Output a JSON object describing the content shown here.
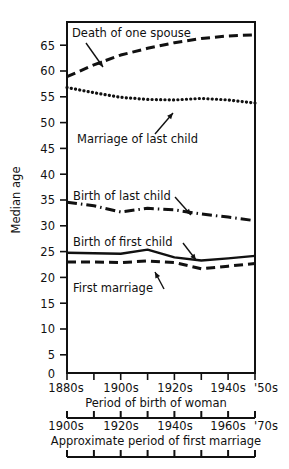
{
  "chart_data": {
    "type": "line",
    "title": "",
    "xlabel": "Period of birth of woman",
    "ylabel": "Median age",
    "secondary_xlabel": "Approximate period of first marriage",
    "ylim": [
      0,
      68
    ],
    "yticks": [
      0,
      5,
      10,
      15,
      20,
      25,
      30,
      35,
      40,
      45,
      50,
      55,
      60,
      65
    ],
    "ytick_labels": [
      "0",
      "5",
      "10",
      "15",
      "20",
      "25",
      "30",
      "35",
      "40",
      "45",
      "50",
      "55",
      "60",
      "65"
    ],
    "grid": false,
    "legend_position": "inline-annotations",
    "x": [
      1880,
      1890,
      1900,
      1910,
      1920,
      1930,
      1940,
      1950
    ],
    "xtick_labels": [
      "1880s",
      "",
      "1900s",
      "",
      "1920s",
      "",
      "1940s",
      "'50s"
    ],
    "xtick_labels_full": [
      "1880s",
      "1890s",
      "1900s",
      "1910s",
      "1920s",
      "1930s",
      "1940s",
      "'50s"
    ],
    "secondary_xtick_labels": [
      "1900s",
      "",
      "1920s",
      "",
      "1940s",
      "",
      "1960s",
      "'70s"
    ],
    "secondary_xtick_labels_full": [
      "1900s",
      "1910s",
      "1920s",
      "1930s",
      "1940s",
      "1950s",
      "1960s",
      "'70s"
    ],
    "series": [
      {
        "name": "Death of one spouse",
        "style": "dashed",
        "values": [
          57.4,
          59.7,
          61.6,
          62.9,
          64.0,
          64.8,
          65.3,
          65.5
        ],
        "label_text": "Death of one spouse",
        "label_x": 72,
        "label_y": 37,
        "arrow_from_x": 86,
        "arrow_from_y": 43,
        "arrow_to_x": 103,
        "arrow_to_y": 67
      },
      {
        "name": "Marriage of last child",
        "style": "dotted",
        "values": [
          55.3,
          54.3,
          53.4,
          53.0,
          52.9,
          53.2,
          52.9,
          52.3
        ],
        "label_text": "Marriage of last child",
        "label_x": 77,
        "label_y": 143,
        "arrow_from_x": 155,
        "arrow_from_y": 134,
        "arrow_to_x": 173,
        "arrow_to_y": 113
      },
      {
        "name": "Birth of last child",
        "style": "dashdot",
        "values": [
          33.1,
          32.4,
          31.2,
          31.9,
          31.6,
          30.8,
          30.2,
          29.5
        ],
        "label_text": "Birth of last child",
        "label_x": 73,
        "label_y": 200,
        "arrow_from_x": 175,
        "arrow_from_y": 197,
        "arrow_to_x": 191,
        "arrow_to_y": 215
      },
      {
        "name": "Birth of first child",
        "style": "solid",
        "values": [
          23.3,
          23.2,
          23.1,
          23.9,
          22.4,
          21.8,
          22.2,
          22.7
        ],
        "label_text": "Birth of first child",
        "label_x": 73,
        "label_y": 246,
        "arrow_from_x": 183,
        "arrow_from_y": 243,
        "arrow_to_x": 196,
        "arrow_to_y": 260
      },
      {
        "name": "First marriage",
        "style": "dashed",
        "values": [
          21.5,
          21.5,
          21.4,
          21.7,
          21.4,
          20.2,
          20.7,
          21.2
        ],
        "label_text": "First marriage",
        "label_x": 73,
        "label_y": 292,
        "arrow_from_x": 164,
        "arrow_from_y": 289,
        "arrow_to_x": 155,
        "arrow_to_y": 272
      }
    ]
  }
}
